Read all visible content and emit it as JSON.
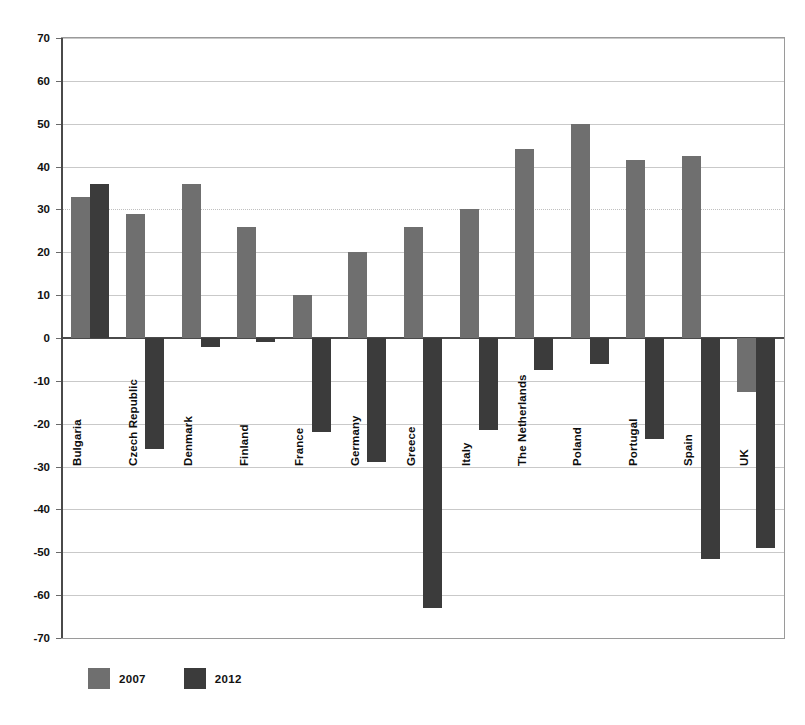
{
  "chart_data": {
    "type": "bar",
    "title": "",
    "subtitle": "",
    "xlabel": "",
    "ylabel": "",
    "ylim": [
      -70,
      70
    ],
    "ytick_step": 10,
    "yticks": [
      70,
      60,
      50,
      40,
      30,
      20,
      10,
      0,
      -10,
      -20,
      -30,
      -40,
      -50,
      -60,
      -70
    ],
    "ytick_labels": [
      "70",
      "60",
      "50",
      "40",
      "30",
      "20",
      "10",
      "0",
      "-10",
      "-20",
      "-30",
      "-40",
      "-50",
      "-60",
      "-70"
    ],
    "grid": true,
    "legend_position": "bottom-left",
    "categories": [
      "Bulgaria",
      "Czech Republic",
      "Denmark",
      "Finland",
      "France",
      "Germany",
      "Greece",
      "Italy",
      "The Netherlands",
      "Poland",
      "Portugal",
      "Spain",
      "UK"
    ],
    "series": [
      {
        "name": "2007",
        "color": "#6f6f6f",
        "values": [
          33,
          29,
          36,
          26,
          10,
          20,
          26,
          30,
          44,
          50,
          41.5,
          42.5,
          -12.5
        ]
      },
      {
        "name": "2012",
        "color": "#3b3b3b",
        "values": [
          36,
          -26,
          -2,
          -1,
          -22,
          -29,
          -63,
          -21.5,
          -7.5,
          -6,
          -23.5,
          -51.5,
          -49
        ]
      }
    ]
  },
  "legend": {
    "items": [
      {
        "label": "2007",
        "color": "#6f6f6f",
        "swatch_name": "legend-swatch-2007"
      },
      {
        "label": "2012",
        "color": "#3b3b3b",
        "swatch_name": "legend-swatch-2012"
      }
    ]
  },
  "colors": {
    "series_2007": "#6f6f6f",
    "series_2012": "#3b3b3b",
    "gridline": "#c9c9c9",
    "axis": "#4a4a4a",
    "background": "#ffffff",
    "text": "#111111"
  }
}
